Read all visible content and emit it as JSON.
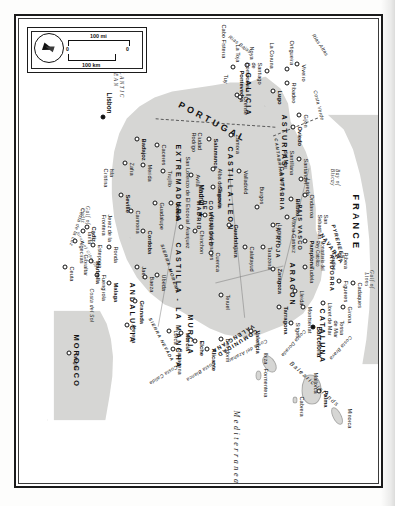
{
  "map": {
    "title": "Spain and Portugal",
    "colors": {
      "land": "#d6d6d4",
      "sea": "#ffffff",
      "frame": "#1b1b1b",
      "text": "#111111"
    },
    "inset": {
      "compass_icon": "compass-rose-north-arrow",
      "scale_miles_label": "100 mi",
      "scale_km_label": "100 km",
      "zero_label_top": "0",
      "zero_label_bottom": "0"
    },
    "countries": [
      {
        "name": "FRANCE"
      },
      {
        "name": "PORTUGAL"
      },
      {
        "name": "MOROCCO"
      },
      {
        "name": "ANDORRA"
      }
    ],
    "regions": [
      {
        "name": "GALICIA"
      },
      {
        "name": "ASTURIAS"
      },
      {
        "name": "CANTABRIA"
      },
      {
        "name": "PAIS VASCO"
      },
      {
        "name": "NAVARRA"
      },
      {
        "name": "LA RIOJA"
      },
      {
        "name": "ARAGON"
      },
      {
        "name": "CATALUNA"
      },
      {
        "name": "CASTILLA-LEON"
      },
      {
        "name": "COMUNIDAD DE MADRID"
      },
      {
        "name": "EXTREMADURA"
      },
      {
        "name": "CASTILLA - LA MANCHA"
      },
      {
        "name": "COMUNIDAD VALENCIANA"
      },
      {
        "name": "MURCIA"
      },
      {
        "name": "ANDALUCIA"
      }
    ],
    "capitals": [
      {
        "name": "Madrid",
        "marker": "star"
      },
      {
        "name": "Lisbon",
        "marker": "star"
      }
    ],
    "cities": [
      "Viveiro",
      "Ortigueira",
      "Ribadeo",
      "La Coruna",
      "Noya",
      "La Toja",
      "Cabo Fisterra",
      "Santiago de Compostela",
      "Pontevedra",
      "Orense",
      "Tuy",
      "Lugo",
      "Gijon",
      "Oviedo",
      "Santander",
      "Santillana del Mar",
      "Laredo",
      "Ondarroa",
      "San Sebastian",
      "Bilbao",
      "Vitoria-Gasteiz",
      "Pamplona",
      "Tudela",
      "Logrono",
      "Burgos",
      "Valladolid",
      "Zamora",
      "Salamanca",
      "Ciudad Rodrigo",
      "Alba de Tormes",
      "Avila",
      "San Lorenzo de El Escorial",
      "Segovia",
      "Guadalajara",
      "Alcala de Henares",
      "Chinchon",
      "Aranjuez",
      "Cuenca",
      "Toledo",
      "Guadalupe",
      "Trujillo",
      "Caceres",
      "Merida",
      "Badajoz",
      "Zafra",
      "Isla Cristina",
      "Jerez de la Frontera",
      "Cadiz",
      "Seville",
      "Carmona",
      "Cordoba",
      "Jaen",
      "Ubeda",
      "Baeza",
      "Granada",
      "Almeria",
      "Malaga",
      "Fuengirola",
      "Marbella",
      "Estepona",
      "Ronda",
      "Gibraltar",
      "Algeciras",
      "Tarifa",
      "Ceuta",
      "Tangier",
      "Cartagena",
      "Lorca",
      "Murcia",
      "Elche",
      "Alicante",
      "Benidorm",
      "Valencia",
      "Teruel",
      "Zaragoza",
      "Calatayud",
      "Tarazona",
      "Lleida",
      "Tarragona",
      "Sitges",
      "Montserrat",
      "Barcelona",
      "Lloret de Mar",
      "Tossa de Mar",
      "Girona",
      "Figueres",
      "Cadaques",
      "Ribera de Cardos",
      "Palma",
      "Mallorca",
      "Ibiza",
      "Minorca",
      "Cabrera",
      "Formentera"
    ],
    "waters": [
      {
        "name": "Mediterranean Sea"
      },
      {
        "name": "ATLANTIC OCEAN"
      },
      {
        "name": "Bay of Biscay"
      },
      {
        "name": "Gulf of Lions"
      },
      {
        "name": "Gulf of Cadiz"
      },
      {
        "name": "Strait of Gibraltar"
      }
    ],
    "coasts": [
      "Rias Altas",
      "Rias Bajas",
      "Costa Verde",
      "Costa del Azahar",
      "Costa Blanca",
      "Costa Calida",
      "Costa del Sol",
      "Costa de la Luz",
      "Costa Brava",
      "Costa Dorada"
    ],
    "ranges": [
      "PYRENEES",
      "CANTABRIAN MTS.",
      "SIERRA MORENA",
      "SIERRA NEVADA"
    ],
    "islands_group": "Balearic Islands",
    "landmarks": [
      "Monasterio del Rey Catolico"
    ]
  }
}
